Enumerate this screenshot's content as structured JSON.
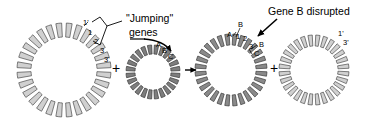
{
  "diagram": {
    "title_semantic": "transposon-insertion-gene-disruption",
    "annotations": {
      "jumping_genes_line1": "\"Jumping\"",
      "jumping_genes_line2": "genes",
      "gene_b_disrupted": "Gene B disrupted"
    },
    "operators": {
      "plus_1": "+",
      "plus_2": "+"
    },
    "circles": [
      {
        "id": "recipient-plasmid",
        "name": "large-light-ring",
        "fill": "#d0d0d0",
        "stroke": "#4a4a4a",
        "cx": 64,
        "cy": 70,
        "router": 47,
        "rinner": 33,
        "segments": 28,
        "labels": [
          {
            "text": "1'",
            "x": 83,
            "y": 19,
            "size": "tiny"
          },
          {
            "text": "1",
            "x": 88,
            "y": 29,
            "size": "tiny"
          },
          {
            "text": "2",
            "x": 94,
            "y": 38,
            "size": "tiny"
          },
          {
            "text": "3",
            "x": 100,
            "y": 47,
            "size": "tiny"
          },
          {
            "text": "3'",
            "x": 104,
            "y": 56,
            "size": "tiny"
          }
        ]
      },
      {
        "id": "transposon-element",
        "name": "small-dark-ring",
        "fill": "#7d7d7d",
        "stroke": "#3a3a3a",
        "cx": 153,
        "cy": 72,
        "router": 27,
        "rinner": 18,
        "segments": 24,
        "labels": [
          {
            "text": "A",
            "x": 156,
            "y": 41,
            "size": "tiny"
          },
          {
            "text": "B",
            "x": 162,
            "y": 47,
            "size": "tiny"
          },
          {
            "text": "C",
            "x": 168,
            "y": 53,
            "size": "tiny"
          }
        ]
      },
      {
        "id": "recombinant-plasmid",
        "name": "medium-dark-ring",
        "fill": "#8a8a8a",
        "stroke": "#3a3a3a",
        "cx": 231,
        "cy": 70,
        "router": 36,
        "rinner": 25,
        "segments": 28,
        "labels": [
          {
            "text": "A",
            "x": 227,
            "y": 31,
            "size": "tiny"
          },
          {
            "text": "B",
            "x": 238,
            "y": 21,
            "size": "tiny"
          },
          {
            "text": "1",
            "x": 236,
            "y": 33,
            "size": "tiny"
          },
          {
            "text": "2",
            "x": 243,
            "y": 35,
            "size": "tiny"
          },
          {
            "text": "3",
            "x": 249,
            "y": 43,
            "size": "tiny"
          },
          {
            "text": "B",
            "x": 259,
            "y": 41,
            "size": "tiny"
          },
          {
            "text": "C",
            "x": 254,
            "y": 50,
            "size": "tiny"
          }
        ]
      },
      {
        "id": "residual-plasmid",
        "name": "large-light-ring-right",
        "fill": "#d0d0d0",
        "stroke": "#4a4a4a",
        "cx": 314,
        "cy": 70,
        "router": 35,
        "rinner": 24,
        "segments": 28,
        "labels": [
          {
            "text": "1'",
            "x": 338,
            "y": 30,
            "size": "tiny"
          },
          {
            "text": "3'",
            "x": 343,
            "y": 39,
            "size": "tiny"
          }
        ]
      }
    ]
  }
}
